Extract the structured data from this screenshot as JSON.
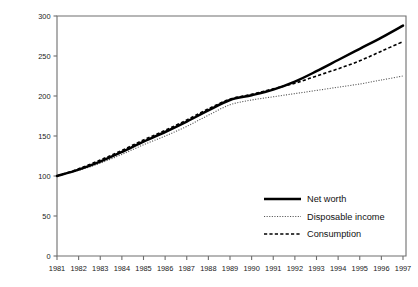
{
  "chart_data": {
    "type": "line",
    "title": "",
    "subtitle": "",
    "xlabel": "",
    "ylabel": "",
    "xlim": [
      1981,
      1997
    ],
    "ylim": [
      0,
      300
    ],
    "grid": false,
    "legend_position": "bottom-right",
    "x": [
      1981,
      1982,
      1983,
      1984,
      1985,
      1986,
      1987,
      1988,
      1989,
      1990,
      1991,
      1992,
      1993,
      1994,
      1995,
      1996,
      1997
    ],
    "xticklabels": [
      "1981",
      "1982",
      "1983",
      "1984",
      "1985",
      "1986",
      "1987",
      "1988",
      "1989",
      "1990",
      "1991",
      "1992",
      "1993",
      "1994",
      "1995",
      "1996",
      "1997"
    ],
    "yticks": [
      0,
      50,
      100,
      150,
      200,
      250,
      300
    ],
    "yticklabels": [
      "0",
      "50",
      "100",
      "150",
      "200",
      "250",
      "300"
    ],
    "series": [
      {
        "name": "Net worth",
        "style": "solid",
        "width": 2.5,
        "color": "#000000",
        "values": [
          100,
          108,
          118,
          130,
          143,
          155,
          168,
          182,
          195,
          201,
          208,
          218,
          231,
          245,
          259,
          273,
          288
        ]
      },
      {
        "name": "Disposable income",
        "style": "dotted",
        "width": 1.1,
        "color": "#555555",
        "values": [
          100,
          107,
          116,
          127,
          139,
          150,
          162,
          176,
          189,
          195,
          199,
          203,
          207,
          211,
          215,
          220,
          225
        ]
      },
      {
        "name": "Consumption",
        "style": "dashed",
        "width": 1.6,
        "color": "#000000",
        "values": [
          100,
          109,
          120,
          132,
          145,
          157,
          170,
          184,
          196,
          202,
          209,
          216,
          225,
          234,
          244,
          256,
          268
        ]
      }
    ],
    "legend_entries": [
      {
        "label": "Net worth",
        "style": "solid"
      },
      {
        "label": "Disposable income",
        "style": "dotted"
      },
      {
        "label": "Consumption",
        "style": "dashed"
      }
    ]
  }
}
